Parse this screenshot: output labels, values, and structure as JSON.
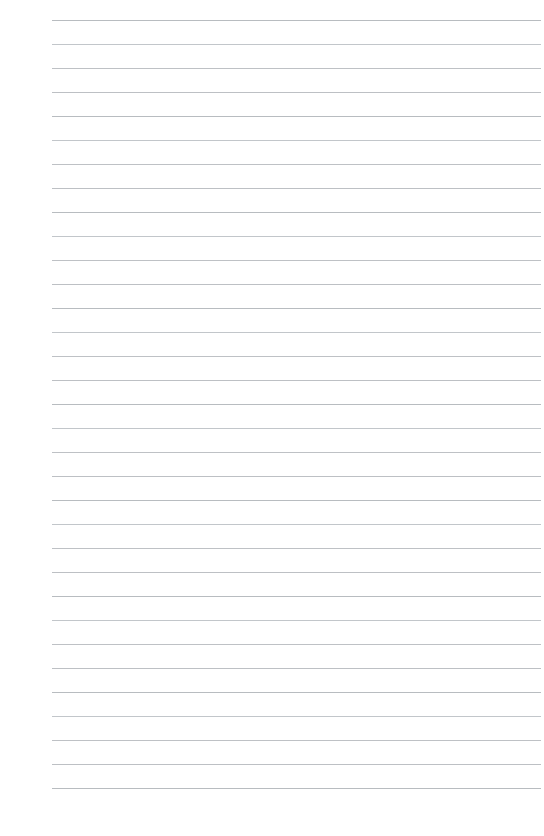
{
  "page": {
    "kind": "ruled-notebook-paper",
    "title": "",
    "body_text": "",
    "background_color": "#ffffff",
    "width": 544,
    "height": 836
  },
  "ruling": {
    "line_color": "#b9bdc1",
    "line_thickness_px": 1,
    "line_count": 33,
    "line_spacing_px": 24,
    "first_line_y": 20,
    "last_line_y": 788,
    "left_margin_x": 52,
    "right_margin_x": 541,
    "line_length_px": 489,
    "has_vertical_margin_rule": false,
    "has_header": false,
    "has_page_number": false,
    "has_holes": false
  }
}
